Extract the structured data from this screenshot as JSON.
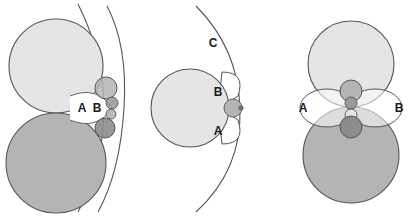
{
  "figure": {
    "background_color": "#ffffff",
    "width": 411,
    "height": 216,
    "stroke_color": "#4a4a4a",
    "palette": {
      "light_gray_circle": "#e5e5e5",
      "mid_gray_circle": "#b4b4b4",
      "dark_small_circle": "#8c8c8c",
      "white_lens": "#ffffff",
      "outline": "#555555",
      "label_text": "#1a1a1a"
    }
  },
  "panels": [
    {
      "id": "panel-left",
      "name": "left-panel",
      "labels": [
        {
          "id": "left-label-a",
          "text": "A",
          "x": 82,
          "y": 110
        },
        {
          "id": "left-label-b",
          "text": "B",
          "x": 97,
          "y": 110
        }
      ],
      "shapes": {
        "big_light_circle": {
          "cx": 56,
          "cy": 66,
          "r": 47,
          "fill": "#e5e5e5"
        },
        "big_mid_circle": {
          "cx": 56,
          "cy": 163,
          "r": 50,
          "fill": "#b4b4b4"
        },
        "outer_arc_left": {
          "cx": -14,
          "cy": 108,
          "r": 124
        },
        "outer_arc_right": {
          "cx": 310,
          "cy": 108,
          "r": 198
        },
        "small_circles": [
          {
            "cx": 106,
            "cy": 88,
            "r": 11,
            "fill": "#b4b4b4"
          },
          {
            "cx": 112,
            "cy": 103,
            "r": 6,
            "fill": "#9a9a9a"
          },
          {
            "cx": 111,
            "cy": 114,
            "r": 5,
            "fill": "#b4b4b4"
          },
          {
            "cx": 105,
            "cy": 128,
            "r": 10,
            "fill": "#8c8c8c"
          }
        ]
      }
    },
    {
      "id": "panel-middle",
      "name": "middle-panel",
      "labels": [
        {
          "id": "mid-label-c",
          "text": "C",
          "x": 213,
          "y": 43
        },
        {
          "id": "mid-label-b",
          "text": "B",
          "x": 217,
          "y": 92
        },
        {
          "id": "mid-label-a",
          "text": "A",
          "x": 217,
          "y": 131
        }
      ],
      "shapes": {
        "big_light_circle": {
          "cx": 190,
          "cy": 108,
          "r": 39,
          "fill": "#e5e5e5"
        },
        "outer_arc": {
          "cx": 28,
          "cy": 108,
          "r": 212
        },
        "lens_top": {
          "cx": 240,
          "cy": 88,
          "r": 20,
          "fill": "#ffffff"
        },
        "lens_bottom": {
          "cx": 240,
          "cy": 128,
          "r": 20,
          "fill": "#ffffff"
        },
        "center_small": {
          "cx": 234,
          "cy": 108,
          "r": 9,
          "fill": "#b4b4b4"
        },
        "center_dot": {
          "cx": 242,
          "cy": 108,
          "r": 2.5,
          "fill": "#6e6e6e"
        }
      }
    },
    {
      "id": "panel-right",
      "name": "right-panel",
      "labels": [
        {
          "id": "right-label-a",
          "text": "A",
          "x": 303,
          "y": 110
        },
        {
          "id": "right-label-b",
          "text": "B",
          "x": 399,
          "y": 110
        }
      ],
      "shapes": {
        "big_light_circle": {
          "cx": 351,
          "cy": 64,
          "r": 43,
          "fill": "#e5e5e5"
        },
        "big_mid_circle": {
          "cx": 351,
          "cy": 155,
          "r": 48,
          "fill": "#b4b4b4"
        },
        "lens_left": {
          "cx": 327,
          "cy": 108,
          "r": 27,
          "fill": "#ffffff"
        },
        "lens_right": {
          "cx": 375,
          "cy": 108,
          "r": 27,
          "fill": "#ffffff"
        },
        "small_circles": [
          {
            "cx": 351,
            "cy": 91,
            "r": 11,
            "fill": "#b4b4b4"
          },
          {
            "cx": 351,
            "cy": 103,
            "r": 6,
            "fill": "#9a9a9a"
          },
          {
            "cx": 351,
            "cy": 115,
            "r": 6,
            "fill": "#e5e5e5"
          },
          {
            "cx": 351,
            "cy": 127,
            "r": 11,
            "fill": "#8c8c8c"
          }
        ]
      }
    }
  ]
}
